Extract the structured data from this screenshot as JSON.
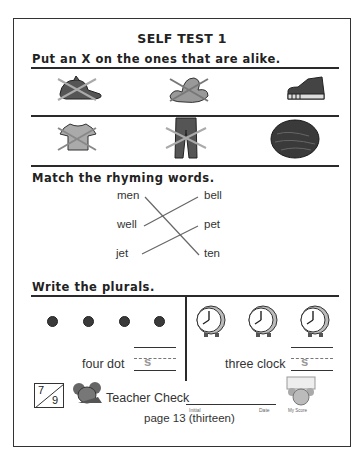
{
  "page": {
    "title": "SELF TEST 1",
    "page_number": "page 13 (thirteen)"
  },
  "section1": {
    "instruction": "Put an X on the ones that are alike.",
    "rows": [
      {
        "items": [
          {
            "icon": "baseball-cap-icon",
            "crossed": true
          },
          {
            "icon": "cowboy-hat-icon",
            "crossed": true
          },
          {
            "icon": "sneaker-icon",
            "crossed": false
          }
        ]
      },
      {
        "items": [
          {
            "icon": "shirt-icon",
            "crossed": true
          },
          {
            "icon": "pants-icon",
            "crossed": true
          },
          {
            "icon": "walnut-icon",
            "crossed": false
          }
        ]
      }
    ]
  },
  "section2": {
    "instruction": "Match the rhyming words.",
    "left_words": [
      "men",
      "well",
      "jet"
    ],
    "right_words": [
      "bell",
      "pet",
      "ten"
    ],
    "matches": [
      {
        "from": "men",
        "to": "ten"
      },
      {
        "from": "well",
        "to": "bell"
      },
      {
        "from": "jet",
        "to": "pet"
      }
    ]
  },
  "section3": {
    "instruction": "Write the plurals.",
    "left": {
      "count": 4,
      "icon": "dot-icon",
      "label": "four dot",
      "answer_hint": "s"
    },
    "right": {
      "count": 3,
      "icon": "alarm-clock-icon",
      "label": "three clock",
      "answer_hint": "s"
    }
  },
  "footer": {
    "score_numerator": "7",
    "score_denominator": "9",
    "teacher_check_label": "Teacher Check",
    "initial_label": "Initial",
    "date_label": "Date",
    "my_score_label": "My Score"
  }
}
